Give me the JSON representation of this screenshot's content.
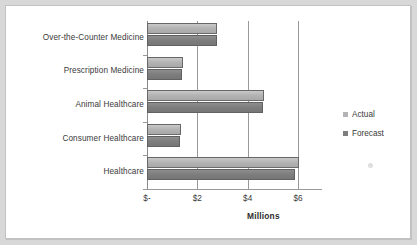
{
  "chart_data": {
    "type": "bar",
    "orientation": "horizontal",
    "title": "",
    "xlabel": "Millions",
    "ylabel": "",
    "categories": [
      "Over-the-Counter Medicine",
      "Prescription Medicine",
      "Animal Healthcare",
      "Consumer Healthcare",
      "Healthcare"
    ],
    "series": [
      {
        "name": "Actual",
        "color": "#b4b4b4",
        "values": [
          2.8,
          1.45,
          4.65,
          1.35,
          6.05
        ]
      },
      {
        "name": "Forecast",
        "color": "#7e7e7e",
        "values": [
          2.8,
          1.4,
          4.6,
          1.3,
          5.9
        ]
      }
    ],
    "xlim": [
      0,
      6
    ],
    "xticks": [
      0,
      2,
      4,
      6
    ],
    "xtick_labels": [
      "$-",
      "$2",
      "$4",
      "$6"
    ],
    "grid": true,
    "legend_position": "right",
    "units": "Millions"
  },
  "legend": {
    "items": [
      {
        "label": "Actual",
        "color": "#b4b4b4"
      },
      {
        "label": "Forecast",
        "color": "#7e7e7e"
      }
    ]
  },
  "axis": {
    "value_axis_title": "Millions"
  }
}
